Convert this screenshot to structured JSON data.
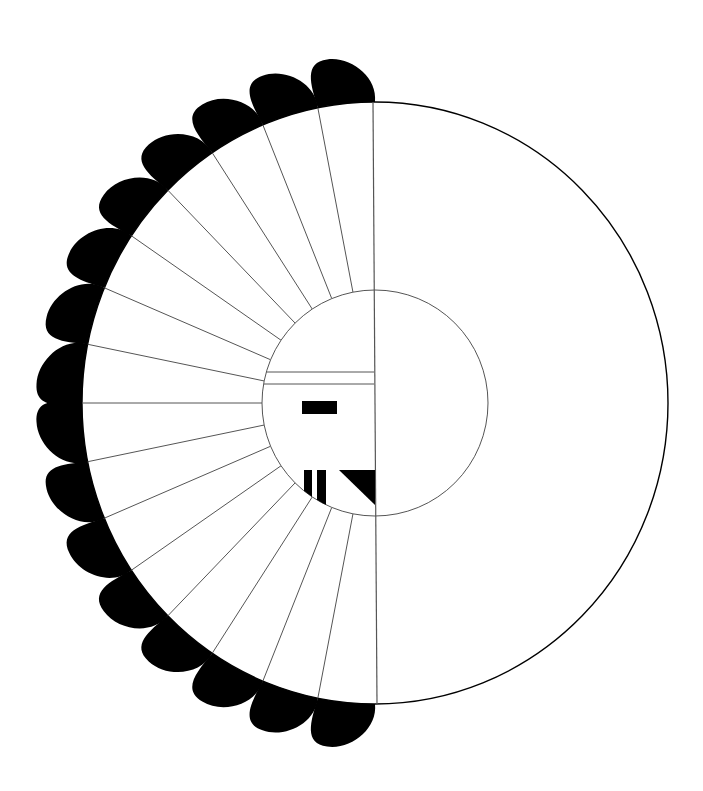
{
  "figure": {
    "width": 703,
    "height": 791,
    "background": "#ffffff",
    "ink": "#000000",
    "thin_line": "#555555",
    "outer_circle": {
      "cx": 375,
      "cy": 403,
      "rx": 293,
      "ry": 301,
      "stroke_width": 1.4
    },
    "inner_circle": {
      "cx": 375,
      "cy": 403,
      "r": 113,
      "stroke_width": 1
    },
    "center_line": {
      "x1": 373,
      "y1": 102,
      "x2": 377,
      "y2": 704
    },
    "feathers": {
      "count": 16,
      "start_angle_deg": 90,
      "step_deg": 11.25,
      "tip_extension": 46,
      "skew_deg": 2.5
    },
    "face": {
      "band_lines": [
        {
          "y": 372
        },
        {
          "y": 384
        }
      ],
      "eye": {
        "x": 302,
        "y": 401,
        "w": 35,
        "h": 13
      },
      "bars": [
        {
          "x": 304,
          "y": 470,
          "w": 8,
          "h": 45
        },
        {
          "x": 317,
          "y": 470,
          "w": 9,
          "h": 45
        }
      ],
      "mouth_triangle": [
        [
          339,
          470
        ],
        [
          375,
          470
        ],
        [
          375,
          505
        ]
      ]
    }
  }
}
